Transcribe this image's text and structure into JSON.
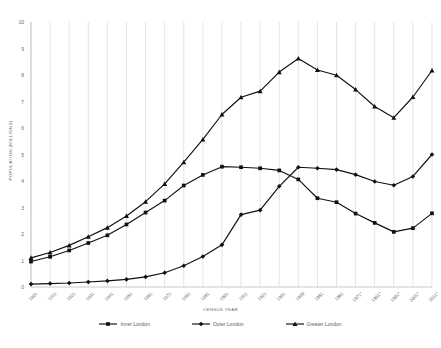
{
  "chart_data": {
    "type": "line",
    "title": "",
    "xlabel": "CENSUS YEAR",
    "ylabel": "POPULATION (MILLIONS)",
    "ylim": [
      0,
      10
    ],
    "yticks": [
      0,
      1,
      2,
      3,
      4,
      5,
      6,
      7,
      8,
      9,
      10
    ],
    "grid": "vertical",
    "legend_position": "bottom",
    "categories": [
      "1801",
      "1811",
      "1821",
      "1831",
      "1841",
      "1851",
      "1861",
      "1871",
      "1881",
      "1891",
      "1901",
      "1911",
      "1921",
      "1931",
      "1939",
      "1951",
      "1961",
      "1971*",
      "1981*",
      "1991*",
      "2001*",
      "2011*"
    ],
    "series": [
      {
        "name": "Inner London",
        "marker": "square",
        "values": [
          0.96,
          1.14,
          1.38,
          1.66,
          1.95,
          2.36,
          2.81,
          3.26,
          3.83,
          4.23,
          4.54,
          4.52,
          4.48,
          4.4,
          4.06,
          3.35,
          3.2,
          2.77,
          2.42,
          2.08,
          2.22,
          2.78
        ]
      },
      {
        "name": "Outer London",
        "marker": "diamond",
        "values": [
          0.11,
          0.13,
          0.15,
          0.19,
          0.23,
          0.29,
          0.38,
          0.54,
          0.8,
          1.15,
          1.59,
          2.73,
          2.9,
          3.8,
          4.52,
          4.48,
          4.43,
          4.24,
          3.98,
          3.84,
          4.17,
          5.0
        ]
      },
      {
        "name": "Greater London",
        "marker": "triangle",
        "values": [
          1.1,
          1.3,
          1.57,
          1.9,
          2.24,
          2.68,
          3.22,
          3.89,
          4.71,
          5.57,
          6.51,
          7.16,
          7.39,
          8.11,
          8.62,
          8.19,
          7.99,
          7.45,
          6.81,
          6.39,
          7.17,
          8.17
        ]
      }
    ]
  },
  "legend": {
    "items": [
      {
        "label": "Inner London"
      },
      {
        "label": "Outer London"
      },
      {
        "label": "Greater London"
      }
    ]
  }
}
